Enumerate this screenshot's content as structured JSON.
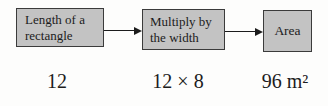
{
  "colors": {
    "background": "#fdfdfc",
    "box_fill": "#c3c3c3",
    "box_border": "#3b3b3b",
    "text": "#1c1c1c",
    "arrow": "#1c1c1c"
  },
  "flowchart": {
    "boxes": [
      {
        "id": "input",
        "line1": "Length of a",
        "line2": "rectangle"
      },
      {
        "id": "operation",
        "line1": "Multiply by",
        "line2": "the width"
      },
      {
        "id": "output",
        "line1": "Area",
        "line2": ""
      }
    ],
    "values": [
      "12",
      "12 × 8",
      "96 m²"
    ]
  },
  "icons": {
    "arrow_right": "→"
  }
}
